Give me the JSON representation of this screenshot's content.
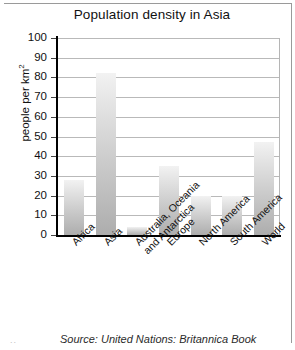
{
  "chart_data": {
    "type": "bar",
    "title": "Population density in Asia",
    "xlabel": "",
    "ylabel": "people per km2",
    "ylabel_display": "people per km",
    "ylabel_exponent": "2",
    "categories": [
      "Africa",
      "Asia",
      "Australia, Oceania and Antarctica",
      "Europe",
      "North America",
      "South America",
      "World"
    ],
    "category_lines": [
      [
        "Africa"
      ],
      [
        "Asia"
      ],
      [
        "Australia, Oceania",
        "and Antarctica"
      ],
      [
        "Europe"
      ],
      [
        "North America"
      ],
      [
        "South America"
      ],
      [
        "World"
      ]
    ],
    "values": [
      28,
      82,
      4,
      35,
      20,
      20,
      47
    ],
    "ylim": [
      0,
      100
    ],
    "ytick_values": [
      0,
      10,
      20,
      30,
      40,
      50,
      60,
      70,
      80,
      90,
      100
    ],
    "ytick_labels": [
      "0",
      "10",
      "20",
      "30",
      "40",
      "50",
      "60",
      "70",
      "80",
      "90",
      "100"
    ],
    "grid": true,
    "legend": "none",
    "bar_color_top": "#f2f2f2",
    "bar_color_bottom": "#adadad",
    "axis_color": "#000000",
    "grid_color": "#b9b9b9"
  },
  "source": {
    "text": "Source: United Nations: Britannica Book"
  },
  "corner": {
    "mark": ".."
  }
}
